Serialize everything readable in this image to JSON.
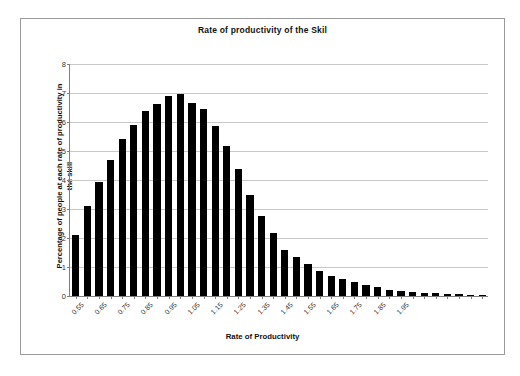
{
  "chart_data": {
    "type": "bar",
    "title": "Rate of productivity of the Skil",
    "xlabel": "Rate of Productivity",
    "ylabel": "Percentage of people at each rate of productivity in the skill",
    "ylabel_line1": "Percentage of people at each rate of productivity in",
    "ylabel_line2": "the skill",
    "ylim": [
      0,
      8
    ],
    "yticks": [
      0,
      1,
      2,
      3,
      4,
      5,
      6,
      7,
      8
    ],
    "ytick_labels": [
      "0",
      "1",
      "2",
      "3",
      "4",
      "5",
      "6",
      "7",
      "8"
    ],
    "grid": true,
    "legend": "none",
    "bar_color": "#000000",
    "categories": [
      "0.55",
      "0.60",
      "0.65",
      "0.70",
      "0.75",
      "0.80",
      "0.85",
      "0.90",
      "0.95",
      "1.00",
      "1.05",
      "1.10",
      "1.15",
      "1.20",
      "1.25",
      "1.30",
      "1.35",
      "1.40",
      "1.45",
      "1.50",
      "1.55",
      "1.60",
      "1.65",
      "1.70",
      "1.75",
      "1.80",
      "1.85",
      "1.90",
      "1.95",
      "2.00",
      "2.05",
      "2.10",
      "2.15",
      "2.20",
      "2.25",
      "2.30"
    ],
    "xtick_labels_shown": [
      "0.55",
      "0.65",
      "0.75",
      "0.85",
      "0.95",
      "1.05",
      "1.15",
      "1.25",
      "1.35",
      "1.45",
      "1.55",
      "1.65",
      "1.75",
      "1.85",
      "1.95"
    ],
    "values": [
      2.1,
      3.1,
      3.92,
      4.7,
      5.4,
      5.88,
      6.38,
      6.63,
      6.88,
      6.98,
      6.67,
      6.45,
      5.86,
      5.18,
      4.38,
      3.48,
      2.77,
      2.17,
      1.6,
      1.35,
      1.1,
      0.85,
      0.68,
      0.58,
      0.47,
      0.38,
      0.3,
      0.22,
      0.17,
      0.13,
      0.11,
      0.09,
      0.07,
      0.06,
      0.05,
      0.04
    ]
  }
}
